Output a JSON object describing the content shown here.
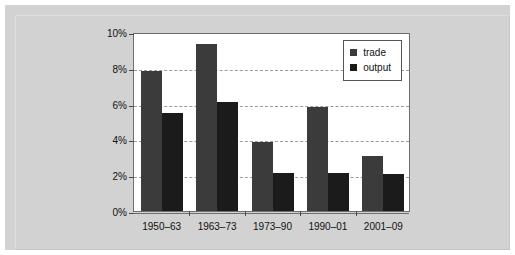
{
  "chart_data": {
    "type": "bar",
    "title": "",
    "xlabel": "",
    "ylabel": "",
    "categories": [
      "1950–63",
      "1963–73",
      "1973–90",
      "1990–01",
      "2001–09"
    ],
    "series": [
      {
        "name": "trade",
        "values": [
          7.8,
          9.35,
          3.85,
          5.8,
          3.05
        ],
        "color": "#3b3b3b"
      },
      {
        "name": "output",
        "values": [
          5.5,
          6.1,
          2.15,
          2.15,
          2.05
        ],
        "color": "#1b1b1b"
      }
    ],
    "ylim": [
      0,
      10
    ],
    "ytick_values": [
      0,
      2,
      4,
      6,
      8,
      10
    ],
    "ytick_labels": [
      "0%",
      "2%",
      "4%",
      "6%",
      "8%",
      "10%"
    ],
    "grid": true,
    "grid_style": "dashed",
    "legend_position": "top-right",
    "legend_entries": [
      "trade",
      "output"
    ]
  },
  "figure": {
    "background_color": "#d2d2d2",
    "plot_background_color": "#ffffff",
    "axis_color": "#6e6e6e",
    "gridline_color": "#9a9a9a"
  }
}
